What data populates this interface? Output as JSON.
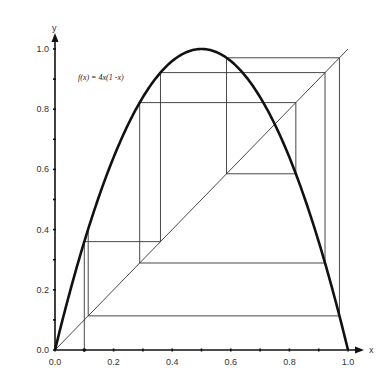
{
  "chart_data": {
    "type": "line",
    "title": "",
    "annotation": "f(x) = 4x(1 -x)",
    "xlabel": "x",
    "ylabel": "y",
    "xlim": [
      0,
      1
    ],
    "ylim": [
      0,
      1
    ],
    "grid": false,
    "legend": "none",
    "x_ticks": [
      0.0,
      0.1,
      0.2,
      0.3,
      0.4,
      0.5,
      0.6,
      0.7,
      0.8,
      0.9,
      1.0
    ],
    "x_tick_labels": [
      "0.0",
      "0.2",
      "0.4",
      "0.6",
      "0.8",
      "1.0"
    ],
    "y_ticks": [
      0.0,
      0.1,
      0.2,
      0.3,
      0.4,
      0.5,
      0.6,
      0.7,
      0.8,
      0.9,
      1.0
    ],
    "y_tick_labels": [
      "0.0",
      "0.2",
      "0.4",
      "0.6",
      "0.8",
      "1.0"
    ],
    "series": [
      {
        "name": "f(x) = 4x(1 -x)",
        "kind": "logistic-map-curve",
        "function": "4x(1-x)",
        "style": "thick",
        "color": "#111111"
      },
      {
        "name": "y = x",
        "kind": "diagonal",
        "x": [
          0,
          1
        ],
        "y": [
          0,
          1
        ],
        "style": "thin",
        "color": "#333333"
      },
      {
        "name": "cobweb",
        "kind": "cobweb-orbit",
        "x0": 0.1,
        "orbit": [
          0.1,
          0.36,
          0.9216,
          0.28901,
          0.82194,
          0.58542,
          0.97081,
          0.11335,
          0.40201
        ],
        "style": "thin",
        "color": "#333333"
      }
    ]
  },
  "labels": {
    "x_axis": "x",
    "y_axis": "y",
    "formula": "f(x) = 4x(1 -x)",
    "x_ticks": [
      "0.0",
      "0.2",
      "0.4",
      "0.6",
      "0.8",
      "1.0"
    ],
    "y_ticks": [
      "0.0",
      "0.2",
      "0.4",
      "0.6",
      "0.8",
      "1.0"
    ]
  }
}
